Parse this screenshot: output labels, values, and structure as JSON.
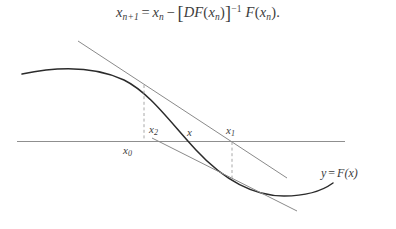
{
  "figure": {
    "kind": "newton-method-diagram",
    "background_color": "#ffffff",
    "ink_color": "#3c3c3c",
    "curve_color": "#2b2b2b",
    "guide_color": "#8f8f8f",
    "dash_color": "#a8a8a8"
  },
  "formula": {
    "lhs_var": "x",
    "lhs_sub": "n+1",
    "equals": "=",
    "term1_var": "x",
    "term1_sub": "n",
    "minus": "−",
    "bracket_open": "[",
    "jacobian": "DF",
    "paren_open": "(",
    "inner_var": "x",
    "inner_sub": "n",
    "paren_close": ")",
    "bracket_close": "]",
    "exponent": "−1",
    "func": "F",
    "period": "."
  },
  "plot": {
    "axis": {
      "label": "horizontal-axis",
      "x_start": 17,
      "x_end": 345,
      "y": 141.5
    },
    "curve": {
      "label": "y = F(x)",
      "path": "M22,74 C60,66 96,67 124,80 C150,93 170,122 196,150 C222,178 252,196 284,196 C306,196 322,191 333,183"
    },
    "tangent_lines": [
      {
        "name": "tangent-at-x0",
        "x1": 78,
        "y1": 41,
        "x2": 287,
        "y2": 178
      },
      {
        "name": "tangent-at-x1",
        "x1": 152,
        "y1": 138,
        "x2": 297,
        "y2": 211
      }
    ],
    "dashed_drops": [
      {
        "name": "drop-x0",
        "x": 144,
        "y_top": 85,
        "y_bottom": 141
      },
      {
        "name": "drop-x1",
        "x": 232,
        "y_top": 142,
        "y_bottom": 178
      }
    ],
    "labels": [
      {
        "name": "label-x0",
        "text": "x",
        "sub": "0",
        "x": 123,
        "y": 144
      },
      {
        "name": "label-x2",
        "text": "x",
        "sub": "2",
        "x": 149,
        "y": 123
      },
      {
        "name": "label-x-star",
        "text": "x",
        "sub": "",
        "x": 187,
        "y": 126
      },
      {
        "name": "label-x1",
        "text": "x",
        "sub": "1",
        "x": 226,
        "y": 124
      }
    ],
    "curve_label": {
      "y_sym": "y",
      "equals": "=",
      "f_sym": "F",
      "paren_open": "(",
      "x_sym": "x",
      "paren_close": ")",
      "x": 321,
      "y": 166
    }
  }
}
